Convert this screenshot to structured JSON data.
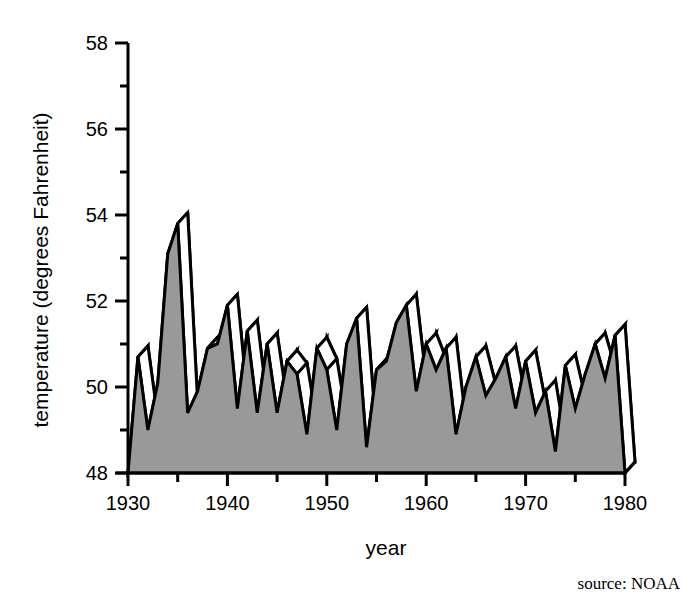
{
  "chart_data": {
    "type": "area",
    "title": "",
    "xlabel": "year",
    "ylabel": "temperature (degrees Fahrenheit)",
    "xlim": [
      1930,
      1980
    ],
    "ylim": [
      48,
      58
    ],
    "x_ticks": [
      1930,
      1935,
      1940,
      1945,
      1950,
      1955,
      1960,
      1965,
      1970,
      1975,
      1980
    ],
    "x_tick_labels": [
      "1930",
      "",
      "1940",
      "",
      "1950",
      "",
      "1960",
      "",
      "1970",
      "",
      "1980"
    ],
    "y_ticks": [
      48,
      49,
      50,
      51,
      52,
      53,
      54,
      55,
      56,
      57,
      58
    ],
    "y_tick_labels": [
      "48",
      "",
      "50",
      "",
      "52",
      "",
      "54",
      "",
      "56",
      "",
      "58"
    ],
    "grid": false,
    "legend": null,
    "style": "3d-ribbon",
    "fill_color": "#999999",
    "line_color": "#000000",
    "depth_dx": 10,
    "depth_dy": -11,
    "source": "source: NOAA",
    "x": [
      1930,
      1931,
      1932,
      1933,
      1934,
      1935,
      1936,
      1937,
      1938,
      1939,
      1940,
      1941,
      1942,
      1943,
      1944,
      1945,
      1946,
      1947,
      1948,
      1949,
      1950,
      1951,
      1952,
      1953,
      1954,
      1955,
      1956,
      1957,
      1958,
      1959,
      1960,
      1961,
      1962,
      1963,
      1964,
      1965,
      1966,
      1967,
      1968,
      1969,
      1970,
      1971,
      1972,
      1973,
      1974,
      1975,
      1976,
      1977,
      1978,
      1979,
      1980
    ],
    "values": [
      48.0,
      50.7,
      49.0,
      50.1,
      53.1,
      53.8,
      49.4,
      49.9,
      50.9,
      51.0,
      51.9,
      49.5,
      51.3,
      49.4,
      51.0,
      49.4,
      50.6,
      50.3,
      48.9,
      50.9,
      50.4,
      49.0,
      51.0,
      51.6,
      48.6,
      50.4,
      50.6,
      51.5,
      51.9,
      49.9,
      51.0,
      50.4,
      50.9,
      48.9,
      50.0,
      50.7,
      49.8,
      50.2,
      50.7,
      49.5,
      50.6,
      49.4,
      49.9,
      48.5,
      50.5,
      49.5,
      50.3,
      51.0,
      50.2,
      51.2,
      48.0
    ],
    "ylabel_unit": "degrees Fahrenheit"
  },
  "axes": {
    "y_axis_name": "temperature-axis",
    "x_axis_name": "year-axis"
  },
  "footer": {
    "source_text": "source: NOAA"
  }
}
